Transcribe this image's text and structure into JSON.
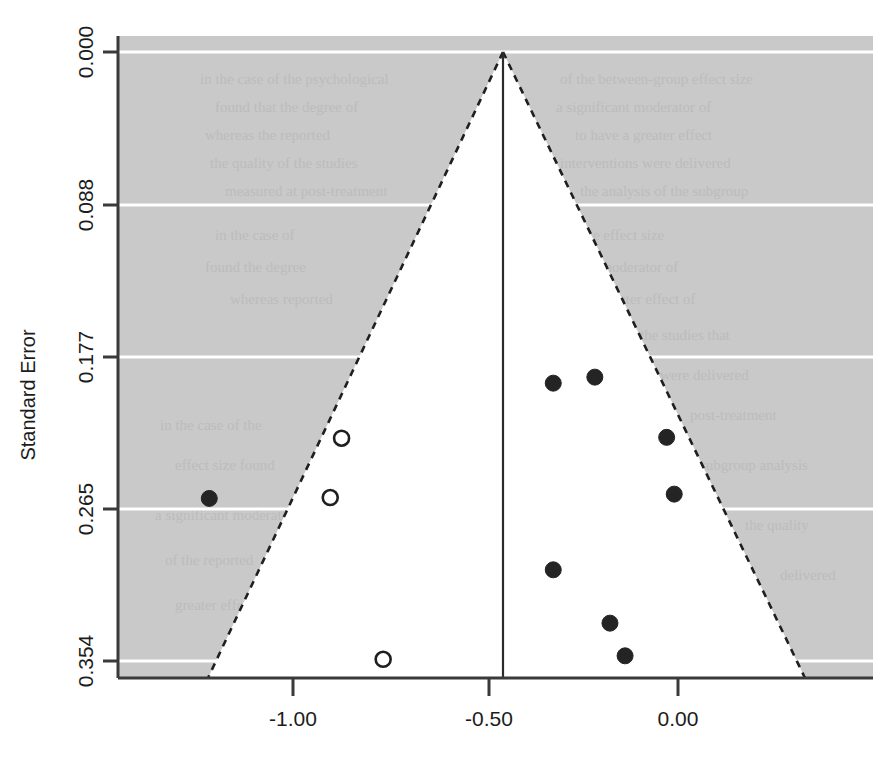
{
  "figure": {
    "background_color": "#ffffff",
    "plot_background_color": "#c9c9c9",
    "funnel_fill_color": "#ffffff",
    "axis_color": "#3a3a3a",
    "gridline_color": "#ffffff",
    "marker_filled_color": "#242424",
    "marker_open_color": "#ffffff",
    "marker_open_edge_color": "#1f1f1f"
  },
  "chart_data": {
    "type": "scatter",
    "title": "",
    "subtitle": "",
    "xlabel": "",
    "ylabel": "Standard Error",
    "xlim": [
      -1.48,
      0.52
    ],
    "ylim": [
      0.0,
      0.3655
    ],
    "y_axis_inverted": true,
    "grid": true,
    "legend_position": "none",
    "xticks": [
      -1.0,
      -0.5,
      0.0
    ],
    "xticklabels": [
      "-1.00",
      "-0.50",
      "0.00"
    ],
    "yticks": [
      0.0,
      0.088,
      0.177,
      0.265,
      0.354
    ],
    "yticklabels": [
      "0.000",
      "0.088",
      "0.177",
      "0.265",
      "0.354"
    ],
    "funnel": {
      "apex_effect": -0.463,
      "apex_se": 0.0,
      "left_leg_effect_at_base": -1.245,
      "right_leg_effect_at_base": 0.335,
      "base_se": 0.3655,
      "line_style": "dashed",
      "center_line_effect": -0.463,
      "center_line_style": "solid"
    },
    "series": [
      {
        "name": "Observed studies",
        "marker": "filled-circle",
        "points": [
          {
            "x": -1.24,
            "y": 0.2595
          },
          {
            "x": -0.33,
            "y": 0.1925
          },
          {
            "x": -0.22,
            "y": 0.189
          },
          {
            "x": -0.03,
            "y": 0.224
          },
          {
            "x": -0.01,
            "y": 0.257
          },
          {
            "x": -0.33,
            "y": 0.301
          },
          {
            "x": -0.18,
            "y": 0.332
          },
          {
            "x": -0.14,
            "y": 0.351
          }
        ]
      },
      {
        "name": "Imputed studies",
        "marker": "open-circle",
        "points": [
          {
            "x": -0.89,
            "y": 0.2245
          },
          {
            "x": -0.92,
            "y": 0.259
          },
          {
            "x": -0.78,
            "y": 0.353
          }
        ]
      }
    ]
  },
  "bleed_text": {
    "note": "faint show-through text from reverse side of scanned page",
    "lines": [
      "in the case of the psychological",
      "of the between-group effect size",
      "found that the degree of",
      "a significant moderator of",
      "whereas the reported",
      "to have a greater effect",
      "the quality of the studies",
      "interventions were delivered",
      "measured at post-treatment",
      "the analysis of the subgroup"
    ]
  }
}
